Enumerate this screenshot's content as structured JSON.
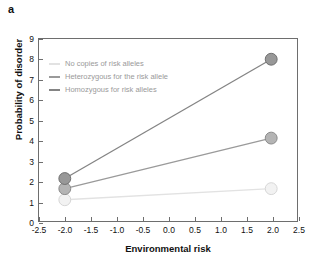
{
  "figure": {
    "panel_label": "a"
  },
  "chart_data": {
    "type": "line",
    "title": "",
    "xlabel": "Environmental risk",
    "ylabel": "Probability of disorder",
    "xlim": [
      -2.5,
      2.5
    ],
    "ylim": [
      0,
      9
    ],
    "xticks": [
      "-2.5",
      "-2.0",
      "-1.5",
      "-1.0",
      "-0.5",
      "0.0",
      "0.5",
      "1.0",
      "1.5",
      "2.0",
      "2.5"
    ],
    "xtick_values": [
      -2.5,
      -2.0,
      -1.5,
      -1.0,
      -0.5,
      0.0,
      0.5,
      1.0,
      1.5,
      2.0,
      2.5
    ],
    "yticks": [
      "0",
      "1",
      "2",
      "3",
      "4",
      "5",
      "6",
      "7",
      "8",
      "9"
    ],
    "ytick_values": [
      0,
      1,
      2,
      3,
      4,
      5,
      6,
      7,
      8,
      9
    ],
    "grid": false,
    "legend_position": "upper left",
    "x": [
      -2.0,
      2.0
    ],
    "series": [
      {
        "name": "No copies of risk alleles",
        "values": [
          1.05,
          1.6
        ],
        "color": "#e2e2e2",
        "marker_fill": "#f2f2f2",
        "marker_edge": "#d6d6d6"
      },
      {
        "name": "Heterozygous for the risk allele",
        "values": [
          1.6,
          4.1
        ],
        "color": "#9a9a9a",
        "marker_fill": "#b4b4b4",
        "marker_edge": "#8a8a8a"
      },
      {
        "name": "Homozygous for risk alleles",
        "values": [
          2.1,
          8.0
        ],
        "color": "#848484",
        "marker_fill": "#989898",
        "marker_edge": "#6f6f6f"
      }
    ]
  },
  "colors": {
    "axis": "#6e6e6e",
    "text": "#111111",
    "legend_text": "#9a9a9a",
    "background": "#ffffff"
  }
}
